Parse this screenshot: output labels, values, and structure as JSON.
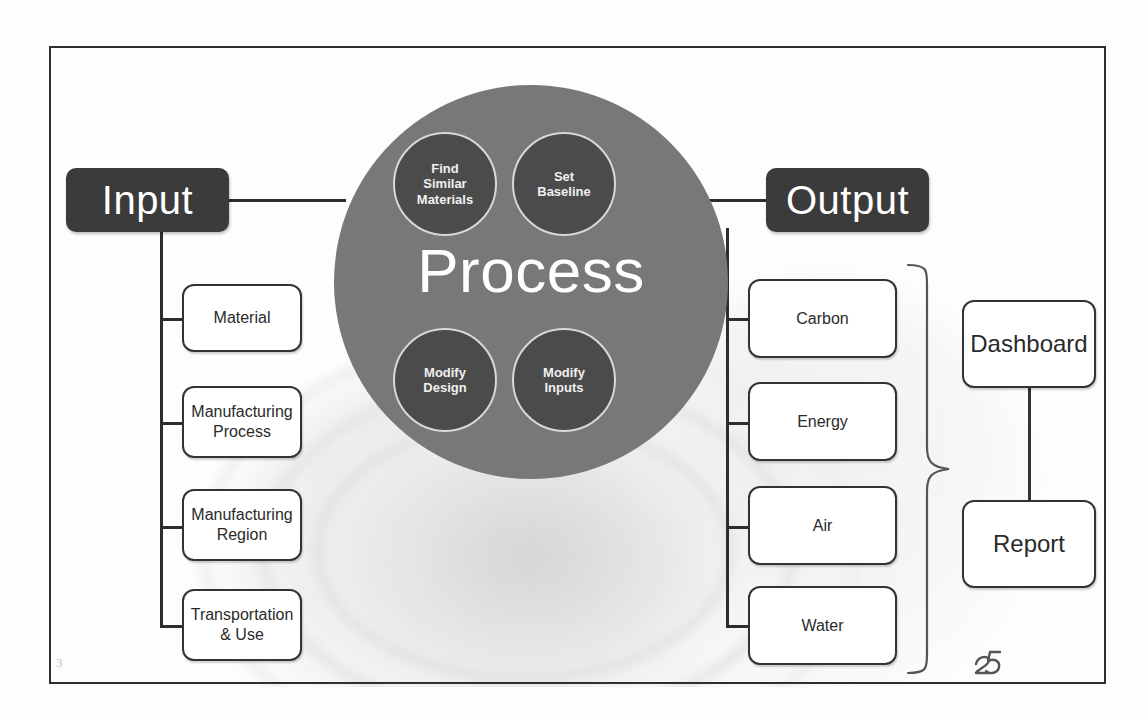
{
  "slide": {
    "page_mark": "25",
    "corner_mark": "3"
  },
  "colors": {
    "dark_box": "#3b3b3b",
    "process_circle": "#787878",
    "sub_circle": "#4b4b4b",
    "sub_circle_ring": "#d8d8d8",
    "box_border": "#333333",
    "line": "#2d2d2d",
    "frame_border": "#2f2f2f",
    "text_light": "#ffffff",
    "text_dark": "#2a2a2a"
  },
  "input": {
    "title": "Input",
    "items": [
      {
        "label": "Material"
      },
      {
        "label": "Manufacturing\nProcess"
      },
      {
        "label": "Manufacturing\nRegion"
      },
      {
        "label": "Transportation\n& Use"
      }
    ]
  },
  "process": {
    "title": "Process",
    "steps": [
      {
        "label": "Find\nSimilar\nMaterials"
      },
      {
        "label": "Set\nBaseline"
      },
      {
        "label": "Modify\nDesign"
      },
      {
        "label": "Modify\nInputs"
      }
    ]
  },
  "output": {
    "title": "Output",
    "items": [
      {
        "label": "Carbon"
      },
      {
        "label": "Energy"
      },
      {
        "label": "Air"
      },
      {
        "label": "Water"
      }
    ]
  },
  "deliverables": {
    "items": [
      {
        "label": "Dashboard"
      },
      {
        "label": "Report"
      }
    ]
  }
}
